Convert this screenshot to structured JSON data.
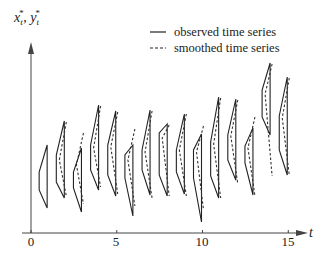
{
  "chart_data": {
    "type": "line",
    "title": "",
    "xlabel": "t",
    "ylabel": "x*_t, y*_t",
    "ylabel_display": "xt*, yt*",
    "xlim": [
      0,
      15.5
    ],
    "x_ticks": [
      0,
      5,
      10,
      15
    ],
    "grid": false,
    "legend": {
      "position": "top-right",
      "entries": [
        {
          "label": "observed time series",
          "style": "solid"
        },
        {
          "label": "smoothed time series",
          "style": "dashed"
        }
      ]
    },
    "series": [
      {
        "name": "observed time series",
        "style": "solid",
        "glyphs": [
          {
            "t": 1,
            "top": 145,
            "mid_top": 172,
            "mid_bot": 190,
            "bottom": 208
          },
          {
            "t": 2,
            "top": 121,
            "mid_top": 155,
            "mid_bot": 182,
            "bottom": 198
          },
          {
            "t": 3,
            "top": 148,
            "mid_top": 172,
            "mid_bot": 188,
            "bottom": 212
          },
          {
            "t": 4,
            "top": 105,
            "mid_top": 145,
            "mid_bot": 170,
            "bottom": 190
          },
          {
            "t": 5,
            "top": 111,
            "mid_top": 145,
            "mid_bot": 175,
            "bottom": 196
          },
          {
            "t": 6,
            "top": 145,
            "mid_top": 155,
            "mid_bot": 178,
            "bottom": 216
          },
          {
            "t": 7,
            "top": 110,
            "mid_top": 150,
            "mid_bot": 170,
            "bottom": 195
          },
          {
            "t": 8,
            "top": 124,
            "mid_top": 133,
            "mid_bot": 175,
            "bottom": 196
          },
          {
            "t": 9,
            "top": 114,
            "mid_top": 150,
            "mid_bot": 172,
            "bottom": 194
          },
          {
            "t": 10,
            "top": 134,
            "mid_top": 150,
            "mid_bot": 178,
            "bottom": 222
          },
          {
            "t": 11,
            "top": 97,
            "mid_top": 142,
            "mid_bot": 176,
            "bottom": 198
          },
          {
            "t": 12,
            "top": 99,
            "mid_top": 135,
            "mid_bot": 160,
            "bottom": 180
          },
          {
            "t": 13,
            "top": 128,
            "mid_top": 146,
            "mid_bot": 163,
            "bottom": 195
          },
          {
            "t": 14,
            "top": 63,
            "mid_top": 90,
            "mid_bot": 117,
            "bottom": 135
          },
          {
            "t": 15,
            "top": 77,
            "mid_top": 116,
            "mid_bot": 150,
            "bottom": 175
          }
        ]
      },
      {
        "name": "smoothed time series",
        "style": "dashed",
        "glyphs": [
          {
            "t": 2,
            "top": 122,
            "mid": 160,
            "bottom": 196
          },
          {
            "t": 3,
            "top": 133,
            "mid": 165,
            "bottom": 204
          },
          {
            "t": 4,
            "top": 106,
            "mid": 148,
            "bottom": 187
          },
          {
            "t": 5,
            "top": 112,
            "mid": 147,
            "bottom": 194
          },
          {
            "t": 6,
            "top": 129,
            "mid": 160,
            "bottom": 206
          },
          {
            "t": 7,
            "top": 111,
            "mid": 152,
            "bottom": 198
          },
          {
            "t": 8,
            "top": 125,
            "mid": 138,
            "bottom": 196
          },
          {
            "t": 9,
            "top": 114,
            "mid": 150,
            "bottom": 196
          },
          {
            "t": 10,
            "top": 126,
            "mid": 152,
            "bottom": 210
          },
          {
            "t": 11,
            "top": 98,
            "mid": 144,
            "bottom": 198
          },
          {
            "t": 12,
            "top": 100,
            "mid": 136,
            "bottom": 184
          },
          {
            "t": 13,
            "top": 117,
            "mid": 148,
            "bottom": 196
          },
          {
            "t": 14,
            "top": 64,
            "mid": 94,
            "bottom": 176
          },
          {
            "t": 15,
            "top": 78,
            "mid": 118,
            "bottom": 175
          }
        ]
      }
    ]
  },
  "labels": {
    "ylabel_x": "x",
    "ylabel_sep": ", ",
    "ylabel_y": "y",
    "sub": "t",
    "sup": "*",
    "xlabel": "t",
    "ticks": [
      "0",
      "5",
      "10",
      "15"
    ],
    "legend_observed": "observed time series",
    "legend_smoothed": "smoothed time series"
  }
}
